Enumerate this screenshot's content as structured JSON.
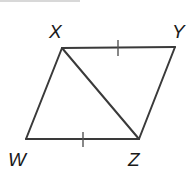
{
  "figure": {
    "type": "parallelogram",
    "vertices": {
      "X": {
        "label": "X",
        "x": 62,
        "y": 48
      },
      "Y": {
        "label": "Y",
        "x": 175,
        "y": 47
      },
      "Z": {
        "label": "Z",
        "x": 139,
        "y": 139
      },
      "W": {
        "label": "W",
        "x": 26,
        "y": 139
      }
    },
    "segments": [
      "XY",
      "YZ",
      "ZW",
      "WX",
      "XZ"
    ],
    "congruence_marks": [
      {
        "segment": "XY",
        "ticks": 1
      },
      {
        "segment": "WZ",
        "ticks": 1
      }
    ],
    "diagonal": "XZ",
    "line_color": "#3a3a3a",
    "label_color": "#1a1a1a"
  }
}
